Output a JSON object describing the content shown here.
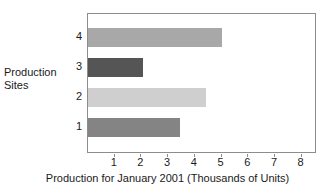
{
  "chart_data": {
    "type": "bar",
    "orientation": "horizontal",
    "title": "",
    "xlabel": "Production for January 2001 (Thousands of Units)",
    "ylabel": "Production Sites",
    "ylabel_lines": [
      "Production",
      "Sites"
    ],
    "categories": [
      "1",
      "2",
      "3",
      "4"
    ],
    "values": [
      3.45,
      4.4,
      2.05,
      5.0
    ],
    "bar_colors": [
      "#848484",
      "#cfcfcf",
      "#555555",
      "#a8a8a8"
    ],
    "xlim": [
      0,
      8.5
    ],
    "xticks": [
      1,
      2,
      3,
      4,
      5,
      6,
      7,
      8
    ],
    "xtick_labels": [
      "1",
      "2",
      "3",
      "4",
      "5",
      "6",
      "7",
      "8"
    ],
    "grid": false,
    "legend": false,
    "frame_color": "#8d8d8d",
    "background": "#ffffff"
  }
}
